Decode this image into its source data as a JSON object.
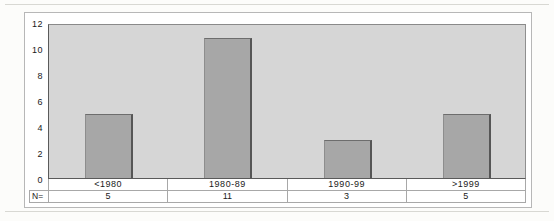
{
  "chart_data": {
    "type": "bar",
    "title": "",
    "xlabel": "",
    "ylabel": "",
    "categories": [
      "<1980",
      "1980-89",
      "1990-99",
      ">1999"
    ],
    "values": [
      5,
      11,
      3,
      5
    ],
    "ylim": [
      0,
      12
    ],
    "yticks": [
      "12",
      "10",
      "8",
      "6",
      "4",
      "2",
      "0"
    ],
    "grid": false,
    "legend": "none",
    "count_row": {
      "label": "N=",
      "values": [
        "5",
        "11",
        "3",
        "5"
      ]
    }
  },
  "colors": {
    "plot_bg": "#d6d6d6",
    "bar_fill": "#a7a7a7",
    "bar_edge": "#565656",
    "axis_line": "#5a5a5a",
    "table_line": "#a8a8a8",
    "frame_border": "#b7b7b7",
    "text": "#1a1a1a",
    "page_bg": "#fcfcfa"
  }
}
